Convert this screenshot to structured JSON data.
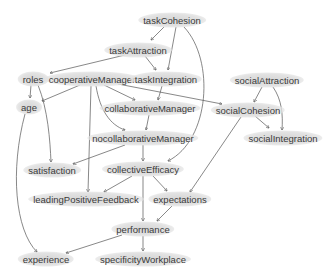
{
  "diagram": {
    "type": "directed-graph",
    "colors": {
      "node_fill": "#dedede",
      "edge": "#555555",
      "text": "#3a3a3a"
    },
    "nodes": [
      {
        "id": "taskCohesion",
        "label": "taskCohesion",
        "x": 172,
        "y": 20
      },
      {
        "id": "taskAttraction",
        "label": "taskAttraction",
        "x": 138,
        "y": 50
      },
      {
        "id": "roles",
        "label": "roles",
        "x": 33,
        "y": 79
      },
      {
        "id": "cooperativeManager",
        "label": "cooperativeManager",
        "x": 92,
        "y": 79
      },
      {
        "id": "taskIntegration",
        "label": "taskIntegration",
        "x": 166,
        "y": 79
      },
      {
        "id": "socialAttraction",
        "label": "socialAttraction",
        "x": 267,
        "y": 80
      },
      {
        "id": "age",
        "label": "age",
        "x": 29,
        "y": 107
      },
      {
        "id": "collaborativeManager",
        "label": "collaborativeManager",
        "x": 150,
        "y": 108
      },
      {
        "id": "socialCohesion",
        "label": "socialCohesion",
        "x": 248,
        "y": 110
      },
      {
        "id": "nocollaborativeManager",
        "label": "nocollaborativeManager",
        "x": 143,
        "y": 138
      },
      {
        "id": "socialIntegration",
        "label": "socialIntegration",
        "x": 283,
        "y": 138
      },
      {
        "id": "satisfaction",
        "label": "satisfaction",
        "x": 52,
        "y": 170
      },
      {
        "id": "collectiveEfficacy",
        "label": "collectiveEfficacy",
        "x": 143,
        "y": 169
      },
      {
        "id": "leadingPositiveFeedback",
        "label": "leadingPositiveFeedback",
        "x": 86,
        "y": 199
      },
      {
        "id": "expectations",
        "label": "expectations",
        "x": 180,
        "y": 199
      },
      {
        "id": "performance",
        "label": "performance",
        "x": 143,
        "y": 229
      },
      {
        "id": "experience",
        "label": "experience",
        "x": 46,
        "y": 259
      },
      {
        "id": "specificityWorkplace",
        "label": "specificityWorkplace",
        "x": 143,
        "y": 259
      }
    ],
    "edges": [
      {
        "from": "taskCohesion",
        "to": "taskAttraction",
        "d": "M164,27 L151,40"
      },
      {
        "from": "taskCohesion",
        "to": "taskIntegration",
        "d": "M176,27 L168,70"
      },
      {
        "from": "taskCohesion",
        "to": "collectiveEfficacy",
        "d": "M184,27 C215,60 210,140 168,161"
      },
      {
        "from": "taskAttraction",
        "to": "roles",
        "d": "M125,55 L50,73"
      },
      {
        "from": "taskAttraction",
        "to": "taskIntegration",
        "d": "M145,56 L156,70"
      },
      {
        "from": "roles",
        "to": "age",
        "d": "M31,85 L30,98"
      },
      {
        "from": "roles",
        "to": "satisfaction",
        "d": "M38,85 C48,110 50,140 51,162"
      },
      {
        "from": "cooperativeManager",
        "to": "age",
        "d": "M80,85 L42,101"
      },
      {
        "from": "cooperativeManager",
        "to": "collaborativeManager",
        "d": "M104,85 L135,100"
      },
      {
        "from": "cooperativeManager",
        "to": "nocollaborativeManager",
        "d": "M96,86 C100,110 110,125 125,130"
      },
      {
        "from": "cooperativeManager",
        "to": "socialCohesion",
        "d": "M118,84 L222,104"
      },
      {
        "from": "cooperativeManager",
        "to": "leadingPositiveFeedback",
        "d": "M91,86 L88,192"
      },
      {
        "from": "taskIntegration",
        "to": "collaborativeManager",
        "d": "M162,86 L158,100"
      },
      {
        "from": "socialAttraction",
        "to": "socialCohesion",
        "d": "M262,87 L254,102"
      },
      {
        "from": "socialAttraction",
        "to": "socialIntegration",
        "d": "M273,87 C282,100 283,115 282,130"
      },
      {
        "from": "socialCohesion",
        "to": "socialIntegration",
        "d": "M255,116 L269,128"
      },
      {
        "from": "socialCohesion",
        "to": "expectations",
        "d": "M241,117 L190,192"
      },
      {
        "from": "age",
        "to": "experience",
        "d": "M25,114 C10,170 15,230 37,252"
      },
      {
        "from": "collaborativeManager",
        "to": "nocollaborativeManager",
        "d": "M149,115 L146,130"
      },
      {
        "from": "nocollaborativeManager",
        "to": "satisfaction",
        "d": "M125,145 L73,164"
      },
      {
        "from": "nocollaborativeManager",
        "to": "collectiveEfficacy",
        "d": "M143,145 L143,161"
      },
      {
        "from": "collectiveEfficacy",
        "to": "leadingPositiveFeedback",
        "d": "M132,176 L104,192"
      },
      {
        "from": "collectiveEfficacy",
        "to": "expectations",
        "d": "M153,176 L167,191"
      },
      {
        "from": "collectiveEfficacy",
        "to": "performance",
        "d": "M143,176 L143,221"
      },
      {
        "from": "expectations",
        "to": "performance",
        "d": "M172,206 L157,221"
      },
      {
        "from": "performance",
        "to": "experience",
        "d": "M122,235 L66,253"
      },
      {
        "from": "performance",
        "to": "specificityWorkplace",
        "d": "M143,236 L143,251"
      }
    ]
  }
}
